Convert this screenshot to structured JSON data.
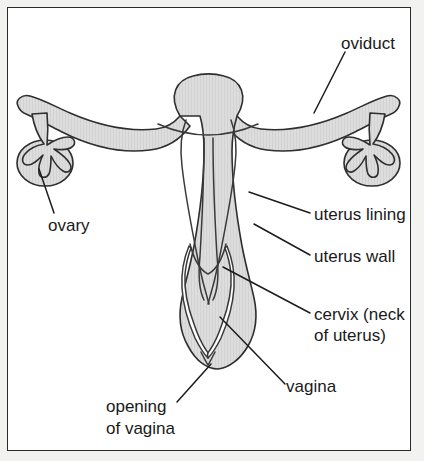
{
  "figure": {
    "background_color": "#ffffff",
    "frame_color": "#2a2a2a",
    "tissue_fill_color": "#dcdcdc",
    "outline_color": "#2e2e2e",
    "leader_line_color": "#1c1c1c",
    "label_text_color": "#1a1a1a"
  },
  "labels": {
    "oviduct": "oviduct",
    "ovary": "ovary",
    "uterus_lining": "uterus lining",
    "uterus_wall": "uterus wall",
    "cervix_line1": "cervix (neck",
    "cervix_line2": "of uterus)",
    "vagina": "vagina",
    "opening_line1": "opening",
    "opening_line2": "of vagina"
  },
  "parts": [
    {
      "id": "oviduct",
      "name": "oviduct",
      "label": "oviduct"
    },
    {
      "id": "ovary",
      "name": "ovary",
      "label": "ovary"
    },
    {
      "id": "uterus-lining",
      "name": "uterus lining",
      "label": "uterus lining"
    },
    {
      "id": "uterus-wall",
      "name": "uterus wall",
      "label": "uterus wall"
    },
    {
      "id": "cervix",
      "name": "cervix",
      "label": "cervix (neck of uterus)"
    },
    {
      "id": "vagina",
      "name": "vagina",
      "label": "vagina"
    },
    {
      "id": "opening-of-vagina",
      "name": "opening of vagina",
      "label": "opening of vagina"
    }
  ]
}
